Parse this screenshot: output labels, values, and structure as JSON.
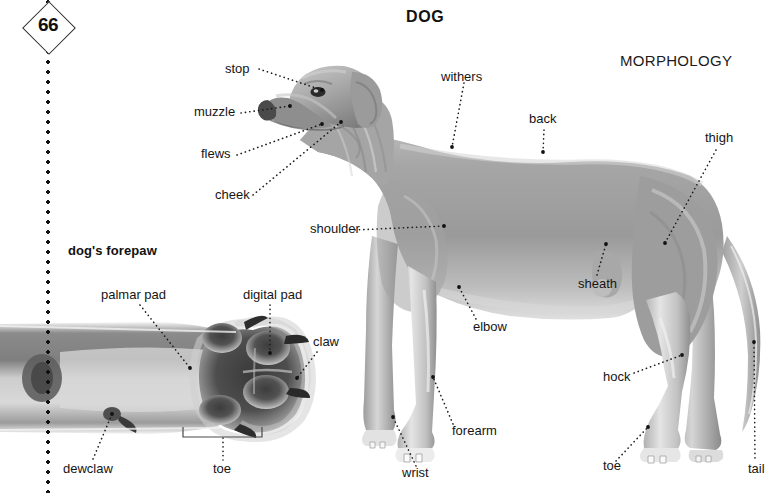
{
  "page": {
    "folio_number": "66",
    "title": "DOG",
    "section": "MORPHOLOGY"
  },
  "forepaw_panel": {
    "title": "dog's forepaw",
    "labels": [
      {
        "id": "palmar-pad",
        "text": "palmar pad"
      },
      {
        "id": "digital-pad",
        "text": "digital pad"
      },
      {
        "id": "claw",
        "text": "claw"
      },
      {
        "id": "dewclaw",
        "text": "dewclaw"
      },
      {
        "id": "toe",
        "text": "toe"
      }
    ]
  },
  "morphology_diagram": {
    "labels": [
      {
        "id": "stop",
        "text": "stop"
      },
      {
        "id": "muzzle",
        "text": "muzzle"
      },
      {
        "id": "flews",
        "text": "flews"
      },
      {
        "id": "cheek",
        "text": "cheek"
      },
      {
        "id": "shoulder",
        "text": "shoulder"
      },
      {
        "id": "withers",
        "text": "withers"
      },
      {
        "id": "back",
        "text": "back"
      },
      {
        "id": "thigh",
        "text": "thigh"
      },
      {
        "id": "sheath",
        "text": "sheath"
      },
      {
        "id": "elbow",
        "text": "elbow"
      },
      {
        "id": "forearm",
        "text": "forearm"
      },
      {
        "id": "wrist",
        "text": "wrist"
      },
      {
        "id": "hock",
        "text": "hock"
      },
      {
        "id": "toe",
        "text": "toe"
      },
      {
        "id": "tail",
        "text": "tail"
      }
    ]
  },
  "colors": {
    "page_background": "#ffffff",
    "ink": "#151515",
    "body_gray": "#9a9a9a",
    "body_gray_light": "#d9d9d9",
    "body_gray_dark": "#6e6e6e",
    "paw_pad_dark": "#4c4c4c",
    "fur_gray": "#8d8d8d"
  }
}
